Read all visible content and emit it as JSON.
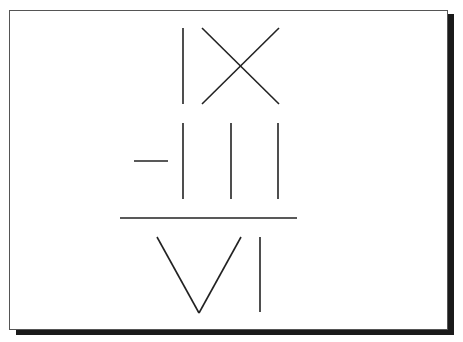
{
  "diagram": {
    "numerator": {
      "left_term": "IX",
      "operator": "-",
      "right_term": "III",
      "expression": "IX - III"
    },
    "denominator": {
      "term": "VI"
    },
    "colors": {
      "stroke": "#222222",
      "frame_border": "#555555",
      "shadow": "#1a1a1a",
      "background": "#ffffff"
    },
    "strokes": {
      "ix_i": {
        "x1": 183,
        "y1": 28,
        "x2": 183,
        "y2": 104
      },
      "ix_x_a": {
        "x1": 202,
        "y1": 28,
        "x2": 279,
        "y2": 104
      },
      "ix_x_b": {
        "x1": 279,
        "y1": 28,
        "x2": 202,
        "y2": 104
      },
      "minus": {
        "x1": 134,
        "y1": 161,
        "x2": 168,
        "y2": 161
      },
      "iii_1": {
        "x1": 183,
        "y1": 123,
        "x2": 183,
        "y2": 199
      },
      "iii_2": {
        "x1": 231,
        "y1": 123,
        "x2": 231,
        "y2": 199
      },
      "iii_3": {
        "x1": 278,
        "y1": 123,
        "x2": 278,
        "y2": 199
      },
      "fraction_bar": {
        "x1": 120,
        "y1": 218,
        "x2": 297,
        "y2": 218
      },
      "vi_v_left": {
        "x1": 157,
        "y1": 237,
        "x2": 199,
        "y2": 313
      },
      "vi_v_right": {
        "x1": 199,
        "y1": 313,
        "x2": 241,
        "y2": 237
      },
      "vi_i": {
        "x1": 260,
        "y1": 237,
        "x2": 260,
        "y2": 312
      }
    }
  }
}
